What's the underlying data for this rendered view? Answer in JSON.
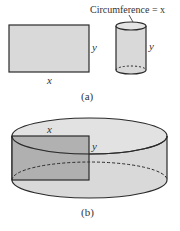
{
  "colors": {
    "stroke": "#2a2a2a",
    "fill_light": "#d9d9d9",
    "fill_dark": "#a8a8a8",
    "text": "#333333"
  },
  "part_a": {
    "rectangle": {
      "width_label": "x",
      "height_label": "y"
    },
    "cylinder": {
      "annotation": "Circumference = x",
      "height_label": "y"
    },
    "caption": "(a)"
  },
  "part_b": {
    "rectangle": {
      "width_label": "x",
      "height_label": "y"
    },
    "caption": "(b)"
  }
}
